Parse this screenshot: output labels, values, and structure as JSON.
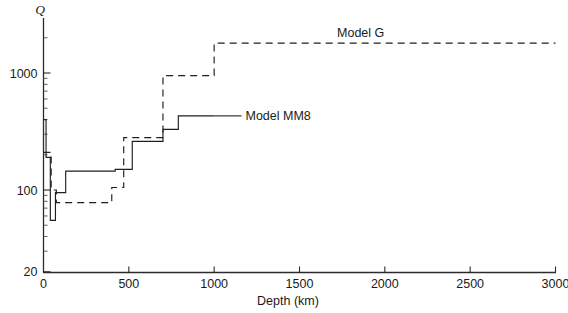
{
  "chart_data": {
    "type": "line",
    "title": "",
    "xlabel": "Depth (km)",
    "ylabel": "Q",
    "xlim": [
      0,
      3000
    ],
    "ylim": [
      20,
      3000
    ],
    "yscale": "log",
    "xscale": "linear",
    "grid": false,
    "legend_position": "inline-annotation",
    "xticks": [
      0,
      500,
      1000,
      1500,
      2000,
      2500,
      3000
    ],
    "xtick_labels": [
      "0",
      "500",
      "1000",
      "1500",
      "2000",
      "2500",
      "3000"
    ],
    "yticks": [
      20,
      100,
      1000
    ],
    "ytick_labels": [
      "20",
      "100",
      "1000"
    ],
    "yminor_ticks": [
      30,
      40,
      50,
      60,
      70,
      80,
      90,
      200,
      300,
      400,
      500,
      600,
      700,
      800,
      900,
      2000,
      3000
    ],
    "series": [
      {
        "name": "Model MM8",
        "style": "solid",
        "label_x": 1215,
        "label_y": 430,
        "steps": [
          {
            "x0": 0,
            "x1": 15,
            "q": 400
          },
          {
            "x0": 15,
            "x1": 40,
            "q": 190
          },
          {
            "x0": 40,
            "x1": 70,
            "q": 55
          },
          {
            "x0": 70,
            "x1": 130,
            "q": 95
          },
          {
            "x0": 130,
            "x1": 420,
            "q": 145
          },
          {
            "x0": 420,
            "x1": 520,
            "q": 150
          },
          {
            "x0": 520,
            "x1": 700,
            "q": 260
          },
          {
            "x0": 700,
            "x1": 790,
            "q": 330
          },
          {
            "x0": 790,
            "x1": 1000,
            "q": 430
          }
        ]
      },
      {
        "name": "Model G",
        "style": "dashed",
        "label_x": 2000,
        "label_y": 2200,
        "steps": [
          {
            "x0": 0,
            "x1": 45,
            "q": 210
          },
          {
            "x0": 45,
            "x1": 75,
            "q": 100
          },
          {
            "x0": 75,
            "x1": 400,
            "q": 78
          },
          {
            "x0": 400,
            "x1": 470,
            "q": 105
          },
          {
            "x0": 470,
            "x1": 700,
            "q": 280
          },
          {
            "x0": 700,
            "x1": 1000,
            "q": 950
          },
          {
            "x0": 1000,
            "x1": 3000,
            "q": 1800
          }
        ]
      }
    ],
    "annotations": [
      {
        "text": "Model MM8",
        "leader_from_x": 1000,
        "leader_from_q": 430,
        "leader_to_x": 1160,
        "leader_to_q": 430
      },
      {
        "text": "Model G",
        "leader_from_x": 1790,
        "leader_from_q": 1800,
        "leader_to_x": 1790,
        "leader_to_q": 1800
      }
    ]
  }
}
